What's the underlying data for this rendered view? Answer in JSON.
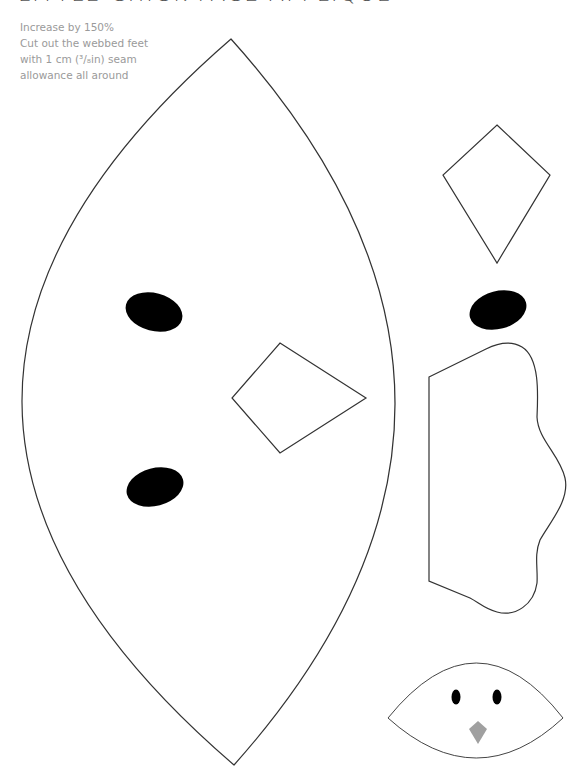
{
  "page": {
    "title": "LITTLE CHICK FACE APPLIQUE",
    "instructions": [
      "Increase by 150%",
      "Cut out the webbed feet",
      "with 1 cm (³/₈in) seam",
      "allowance all around"
    ]
  },
  "pattern_pieces": {
    "head": {
      "label": "head-piece",
      "shape": "lens",
      "outline_color": "#333333",
      "fill": "#ffffff"
    },
    "head_eyes": [
      {
        "label": "upper-eye",
        "cx": 154,
        "cy": 312,
        "rx": 29,
        "ry": 19,
        "rotate": 15,
        "color": "#000000"
      },
      {
        "label": "lower-eye",
        "cx": 155,
        "cy": 487,
        "rx": 29,
        "ry": 19,
        "rotate": -15,
        "color": "#000000"
      }
    ],
    "head_beak": {
      "label": "beak-outline",
      "shape": "quadrilateral"
    },
    "separate_beak": {
      "label": "beak-piece",
      "shape": "kite"
    },
    "separate_eye": {
      "label": "eye-piece",
      "cx": 498,
      "cy": 310,
      "rx": 29,
      "ry": 19,
      "rotate": -15,
      "color": "#000000"
    },
    "foot": {
      "label": "webbed-foot-piece",
      "shape": "webbed-foot"
    },
    "preview": {
      "label": "finished-chick-face-preview",
      "beak_color": "#a0a0a0",
      "eye_color": "#000000"
    }
  },
  "colors": {
    "outline": "#333333",
    "text": "#9a9a9a",
    "title": "#555555",
    "eye": "#000000",
    "beak_preview": "#a0a0a0",
    "background": "#ffffff"
  }
}
